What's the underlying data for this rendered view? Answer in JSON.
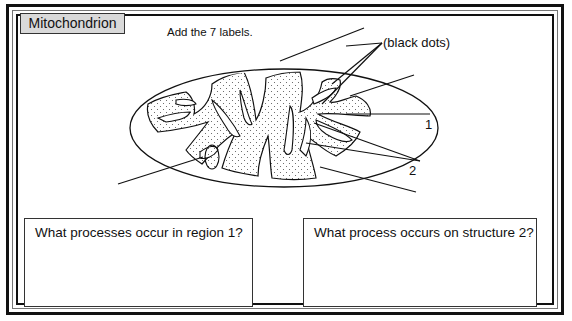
{
  "title": "Mitochondrion",
  "instruction": "Add the 7 labels.",
  "labels": {
    "black_dots": "(black dots)",
    "region_1": "1",
    "structure_2": "2"
  },
  "label_line_count": 7,
  "questions": [
    {
      "text": "What processes occur in region 1?"
    },
    {
      "text": "What process occurs on structure 2?"
    }
  ],
  "colors": {
    "title_background": "#d9d9d9",
    "stroke": "#111111",
    "matrix_dots": "#555555"
  }
}
